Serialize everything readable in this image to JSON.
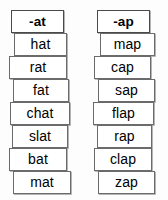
{
  "chart_data": {
    "type": "table",
    "columns": [
      {
        "header": "-at",
        "words": [
          "hat",
          "rat",
          "fat",
          "chat",
          "slat",
          "bat",
          "mat"
        ]
      },
      {
        "header": "-ap",
        "words": [
          "map",
          "cap",
          "sap",
          "flap",
          "rap",
          "clap",
          "zap"
        ]
      }
    ]
  },
  "colors": {
    "background": "#fdfdfd",
    "card_fill": "#ffffff",
    "card_border": "#6b6b6b",
    "header_border": "#4a4a4a",
    "text": "#000000"
  },
  "layout": {
    "left_column": {
      "header": {
        "x": 11,
        "y": 10,
        "w": 53,
        "h": 23
      },
      "cards": [
        {
          "x": 14,
          "y": 33,
          "w": 53,
          "h": 23
        },
        {
          "x": 9,
          "y": 56,
          "w": 58,
          "h": 23
        },
        {
          "x": 13,
          "y": 79,
          "w": 56,
          "h": 23
        },
        {
          "x": 10,
          "y": 102,
          "w": 60,
          "h": 23
        },
        {
          "x": 12,
          "y": 125,
          "w": 56,
          "h": 23
        },
        {
          "x": 9,
          "y": 148,
          "w": 58,
          "h": 23
        },
        {
          "x": 13,
          "y": 171,
          "w": 58,
          "h": 23
        }
      ]
    },
    "right_column": {
      "header": {
        "x": 13,
        "y": 10,
        "w": 53,
        "h": 23
      },
      "cards": [
        {
          "x": 16,
          "y": 33,
          "w": 55,
          "h": 23
        },
        {
          "x": 10,
          "y": 56,
          "w": 57,
          "h": 23
        },
        {
          "x": 14,
          "y": 79,
          "w": 57,
          "h": 23
        },
        {
          "x": 9,
          "y": 102,
          "w": 61,
          "h": 23
        },
        {
          "x": 13,
          "y": 125,
          "w": 55,
          "h": 23
        },
        {
          "x": 10,
          "y": 148,
          "w": 58,
          "h": 23
        },
        {
          "x": 14,
          "y": 171,
          "w": 57,
          "h": 23
        }
      ]
    }
  }
}
